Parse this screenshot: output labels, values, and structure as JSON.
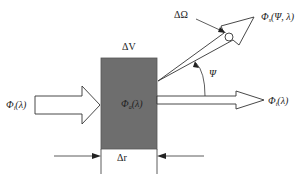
{
  "diagram": {
    "volume_label": "ΔV",
    "thickness_label": "Δr",
    "solid_angle_label": "ΔΩ",
    "angle_label": "Ψ",
    "incident": {
      "symbol": "Φ",
      "sub": "i",
      "arg": "(λ)"
    },
    "absorbed": {
      "symbol": "Φ",
      "sub": "a",
      "arg": "(λ)"
    },
    "transmitted": {
      "symbol": "Φ",
      "sub": "t",
      "arg": "(λ)"
    },
    "scattered": {
      "symbol": "Φ",
      "sub": "s",
      "arg": "(Ψ, λ)"
    },
    "colors": {
      "volume_fill": "#6e6e6e",
      "stroke": "#333333",
      "background": "#ffffff"
    }
  }
}
